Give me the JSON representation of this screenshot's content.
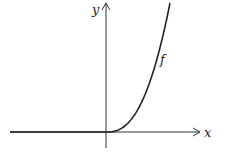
{
  "diagram": {
    "title": "",
    "x_axis_label": "x",
    "y_axis_label": "y",
    "function_label": "f"
  },
  "colors": {
    "axis": "#333333",
    "curve": "#222222",
    "background": "#ffffff"
  }
}
